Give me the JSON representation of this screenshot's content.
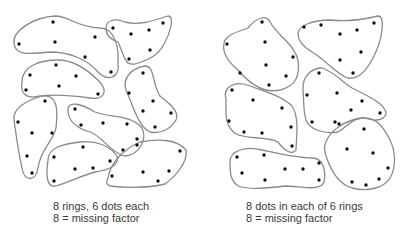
{
  "colors": {
    "ring_stroke": "#8a8a8a",
    "dot": "#111111",
    "text": "#3a3a3a",
    "background": "#ffffff"
  },
  "left_panel": {
    "caption_line1": "8 rings, 6 dots each",
    "caption_line2": "8 = missing factor",
    "ring_count": 8,
    "dots_per_ring": 6,
    "rings": [
      {
        "path": "M14,44 C12,30 35,17 55,16 C70,16 75,27 100,28 C115,28 119,48 118,63 C120,78 108,82 98,72 C88,60 70,52 50,52 C30,54 16,56 14,44 Z",
        "dots": [
          [
            53,
            22
          ],
          [
            19,
            44
          ],
          [
            55,
            42
          ],
          [
            95,
            37
          ],
          [
            85,
            57
          ],
          [
            111,
            72
          ]
        ]
      },
      {
        "path": "M106,28 C106,20 115,18 125,22 C140,26 155,20 168,16 C175,16 170,34 164,44 C158,56 148,60 135,64 C124,66 124,54 118,42 C108,38 106,34 106,28 Z",
        "dots": [
          [
            113,
            28
          ],
          [
            131,
            34
          ],
          [
            149,
            30
          ],
          [
            163,
            23
          ],
          [
            150,
            50
          ],
          [
            129,
            59
          ]
        ]
      },
      {
        "path": "M22,82 C22,66 40,60 58,60 C75,60 90,72 100,82 C108,92 104,100 90,98 C75,96 55,94 40,96 C25,100 20,92 22,82 Z",
        "dots": [
          [
            30,
            75
          ],
          [
            56,
            65
          ],
          [
            76,
            76
          ],
          [
            26,
            90
          ],
          [
            59,
            86
          ],
          [
            98,
            94
          ]
        ]
      },
      {
        "path": "M126,90 C122,78 132,68 145,66 C155,66 152,84 160,96 C170,104 180,112 176,120 C170,130 160,134 150,132 C138,126 134,108 126,90 Z",
        "dots": [
          [
            143,
            73
          ],
          [
            129,
            93
          ],
          [
            153,
            101
          ],
          [
            143,
            111
          ],
          [
            171,
            113
          ],
          [
            155,
            127
          ]
        ]
      },
      {
        "path": "M14,120 C12,108 28,100 42,96 C58,94 58,110 56,128 C54,140 40,150 38,168 C36,182 24,182 22,168 C18,150 16,134 14,120 Z",
        "dots": [
          [
            45,
            101
          ],
          [
            18,
            122
          ],
          [
            32,
            133
          ],
          [
            52,
            133
          ],
          [
            27,
            156
          ],
          [
            32,
            173
          ]
        ]
      },
      {
        "path": "M68,110 C68,100 82,104 95,112 C110,118 130,114 142,128 C148,140 138,156 124,156 C110,152 102,136 90,132 C76,128 68,120 68,110 Z",
        "dots": [
          [
            75,
            109
          ],
          [
            81,
            125
          ],
          [
            103,
            123
          ],
          [
            127,
            124
          ],
          [
            137,
            139
          ],
          [
            123,
            150
          ]
        ]
      },
      {
        "path": "M48,160 C48,148 62,144 80,142 C96,140 110,146 117,156 C120,166 108,170 95,172 C80,176 70,182 56,186 C46,188 46,174 48,160 Z",
        "dots": [
          [
            54,
            157
          ],
          [
            83,
            147
          ],
          [
            110,
            161
          ],
          [
            75,
            169
          ],
          [
            93,
            168
          ],
          [
            54,
            181
          ]
        ]
      },
      {
        "path": "M108,178 C110,164 122,150 140,142 C160,138 178,140 186,150 C188,162 176,176 165,184 C150,188 125,188 110,186 C106,184 106,182 108,178 Z",
        "dots": [
          [
            137,
            145
          ],
          [
            180,
            151
          ],
          [
            169,
            171
          ],
          [
            112,
            176
          ],
          [
            143,
            172
          ],
          [
            158,
            181
          ]
        ]
      }
    ]
  },
  "right_panel": {
    "caption_line1": "8 dots in each of 6 rings",
    "caption_line2": "8 = missing factor",
    "ring_count": 6,
    "dots_per_ring": 8,
    "rings": [
      {
        "path": "M224,44 C224,36 236,32 248,28 C256,18 266,14 270,22 C278,36 294,44 298,60 C300,76 296,86 280,90 C262,94 248,82 238,70 C228,62 222,52 224,44 Z",
        "dots": [
          [
            262,
            22
          ],
          [
            227,
            44
          ],
          [
            265,
            42
          ],
          [
            293,
            57
          ],
          [
            266,
            65
          ],
          [
            240,
            73
          ],
          [
            286,
            76
          ],
          [
            269,
            85
          ]
        ]
      },
      {
        "path": "M298,34 C298,26 312,20 330,20 C348,22 362,20 378,16 C386,16 382,40 374,56 C366,72 358,80 348,78 C336,74 326,60 312,52 C302,46 298,40 298,34 Z",
        "dots": [
          [
            304,
            27
          ],
          [
            321,
            25
          ],
          [
            340,
            34
          ],
          [
            357,
            30
          ],
          [
            374,
            23
          ],
          [
            361,
            52
          ],
          [
            340,
            60
          ],
          [
            353,
            73
          ]
        ]
      },
      {
        "path": "M226,100 C222,86 236,80 250,86 C266,92 282,96 292,106 C300,118 296,140 296,150 C292,156 284,150 278,142 C268,136 250,140 236,134 C224,126 226,112 226,100 Z",
        "dots": [
          [
            232,
            90
          ],
          [
            253,
            100
          ],
          [
            282,
            108
          ],
          [
            229,
            121
          ],
          [
            244,
            132
          ],
          [
            262,
            133
          ],
          [
            291,
            127
          ],
          [
            292,
            146
          ]
        ]
      },
      {
        "path": "M303,90 C302,76 312,68 322,68 C334,72 340,80 352,88 C368,96 386,104 386,114 C384,120 376,122 364,118 C352,118 348,126 338,132 C324,134 310,130 306,120 C303,110 304,100 303,90 Z",
        "dots": [
          [
            319,
            73
          ],
          [
            307,
            95
          ],
          [
            337,
            93
          ],
          [
            362,
            101
          ],
          [
            351,
            110
          ],
          [
            380,
            113
          ],
          [
            312,
            122
          ],
          [
            335,
            122
          ]
        ]
      },
      {
        "path": "M230,162 C230,150 246,146 262,150 C280,154 296,158 312,158 C324,158 326,172 324,182 C320,192 300,186 285,186 C268,188 250,190 238,186 C230,180 230,172 230,162 Z",
        "dots": [
          [
            237,
            157
          ],
          [
            264,
            155
          ],
          [
            242,
            173
          ],
          [
            285,
            169
          ],
          [
            303,
            169
          ],
          [
            319,
            163
          ],
          [
            265,
            180
          ],
          [
            319,
            180
          ]
        ]
      },
      {
        "path": "M326,142 C330,130 346,120 362,118 C376,116 384,128 390,140 C396,152 396,168 390,178 C384,188 368,192 352,188 C338,184 330,168 326,156 C324,150 324,146 326,142 Z",
        "dots": [
          [
            339,
            124
          ],
          [
            364,
            129
          ],
          [
            347,
            149
          ],
          [
            373,
            153
          ],
          [
            388,
            168
          ],
          [
            379,
            179
          ],
          [
            352,
            182
          ],
          [
            366,
            185
          ]
        ]
      }
    ]
  }
}
